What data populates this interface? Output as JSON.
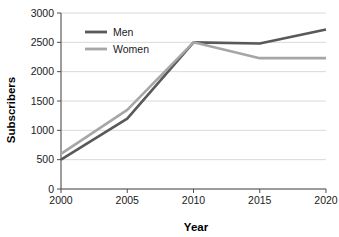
{
  "chart_data": {
    "type": "line",
    "title": "",
    "xlabel": "Year",
    "ylabel": "Subscribers",
    "categories": [
      "2000",
      "2005",
      "2010",
      "2015",
      "2020"
    ],
    "x": [
      2000,
      2005,
      2010,
      2015,
      2020
    ],
    "series": [
      {
        "name": "Men",
        "color": "#595959",
        "values": [
          500,
          1200,
          2500,
          2480,
          2720
        ]
      },
      {
        "name": "Women",
        "color": "#a6a6a6",
        "values": [
          600,
          1350,
          2500,
          2230,
          2230
        ]
      }
    ],
    "xlim": [
      2000,
      2020
    ],
    "ylim": [
      0,
      3000
    ],
    "ytick_labels": [
      "0",
      "500",
      "1000",
      "1500",
      "2000",
      "2500",
      "3000"
    ],
    "ytick_values": [
      0,
      500,
      1000,
      1500,
      2000,
      2500,
      3000
    ],
    "xtick_labels": [
      "2000",
      "2005",
      "2010",
      "2015",
      "2020"
    ],
    "grid": "horizontal",
    "legend_position": "top-left-inside",
    "legend_entries": [
      "Men",
      "Women"
    ],
    "background_color": "#ffffff"
  }
}
